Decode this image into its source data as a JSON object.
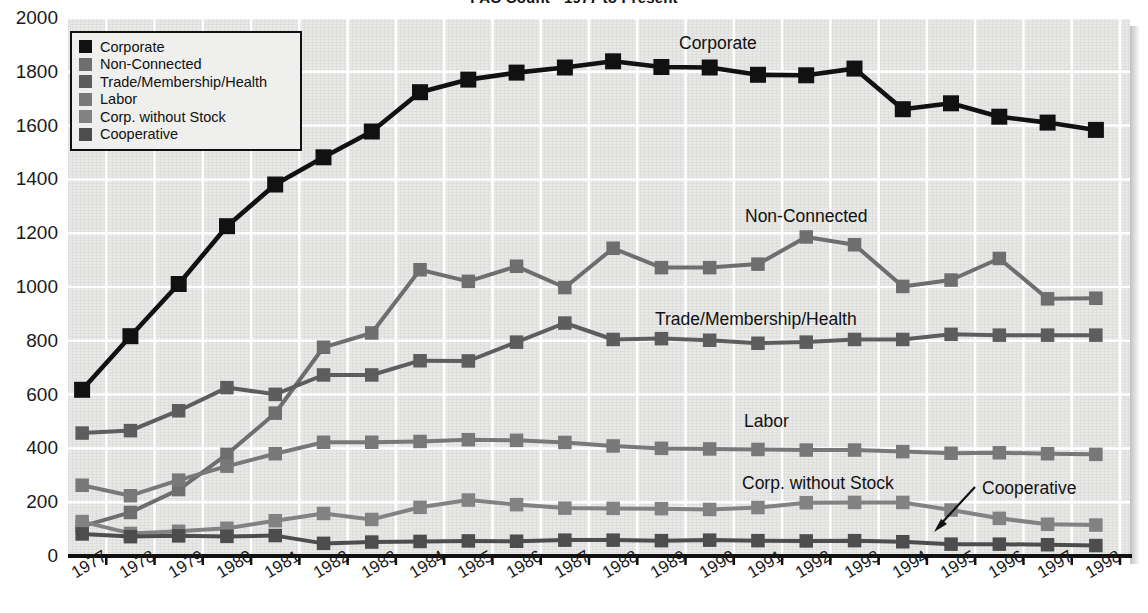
{
  "chart_data": {
    "type": "line",
    "title": "PAC Count - 1977 to Present",
    "xlabel": "",
    "ylabel": "",
    "ylim": [
      0,
      2000
    ],
    "ytick_step": 200,
    "grid": true,
    "legend_position": "top-left",
    "categories": [
      "1977",
      "1978",
      "1979",
      "1980",
      "1981",
      "1982",
      "1983",
      "1984",
      "1985",
      "1986",
      "1987",
      "1988",
      "1989",
      "1990",
      "1991",
      "1992",
      "1993",
      "1994",
      "1995",
      "1996",
      "1997",
      "1998"
    ],
    "series": [
      {
        "name": "Corporate",
        "color": "#111111",
        "values": [
          618,
          817,
          1011,
          1226,
          1381,
          1482,
          1578,
          1724,
          1771,
          1797,
          1816,
          1839,
          1818,
          1816,
          1789,
          1787,
          1812,
          1661,
          1683,
          1633,
          1611,
          1584
        ]
      },
      {
        "name": "Non-Connected",
        "color": "#6e6e6e",
        "values": [
          110,
          162,
          247,
          378,
          531,
          776,
          829,
          1064,
          1021,
          1077,
          998,
          1144,
          1072,
          1072,
          1085,
          1186,
          1157,
          1002,
          1026,
          1106,
          956,
          958
        ]
      },
      {
        "name": "Trade/Membership/Health",
        "color": "#5d5d5d",
        "values": [
          457,
          466,
          540,
          626,
          601,
          673,
          673,
          726,
          725,
          795,
          866,
          805,
          808,
          802,
          791,
          795,
          805,
          805,
          824,
          821,
          821,
          821
        ]
      },
      {
        "name": "Labor",
        "color": "#787878",
        "values": [
          263,
          224,
          282,
          334,
          380,
          423,
          423,
          426,
          432,
          430,
          422,
          409,
          400,
          398,
          396,
          394,
          394,
          388,
          382,
          384,
          380,
          378
        ]
      },
      {
        "name": "Corp. without Stock",
        "color": "#828282",
        "values": [
          128,
          84,
          92,
          103,
          131,
          158,
          136,
          181,
          208,
          191,
          178,
          177,
          176,
          173,
          180,
          198,
          199,
          199,
          171,
          140,
          118,
          115
        ]
      },
      {
        "name": "Cooperative",
        "color": "#4d4d4d",
        "values": [
          82,
          72,
          75,
          73,
          76,
          47,
          52,
          54,
          56,
          55,
          59,
          59,
          57,
          59,
          57,
          56,
          57,
          53,
          44,
          44,
          42,
          39
        ]
      }
    ],
    "annotations": [
      {
        "text": "Corporate",
        "series": "Corporate"
      },
      {
        "text": "Non-Connected",
        "series": "Non-Connected"
      },
      {
        "text": "Trade/Membership/Health",
        "series": "Trade/Membership/Health"
      },
      {
        "text": "Labor",
        "series": "Labor"
      },
      {
        "text": "Corp. without Stock",
        "series": "Corp. without Stock"
      },
      {
        "text": "Cooperative",
        "series": "Cooperative",
        "has_arrow": true
      }
    ]
  },
  "legend": {
    "items": [
      {
        "label": "Corporate",
        "color": "#111111"
      },
      {
        "label": "Non-Connected",
        "color": "#6e6e6e"
      },
      {
        "label": "Trade/Membership/Health",
        "color": "#5d5d5d"
      },
      {
        "label": "Labor",
        "color": "#787878"
      },
      {
        "label": "Corp. without Stock",
        "color": "#828282"
      },
      {
        "label": "Cooperative",
        "color": "#4d4d4d"
      }
    ]
  },
  "axes": {
    "y_ticks": [
      "2000",
      "1800",
      "1600",
      "1400",
      "1200",
      "1000",
      "800",
      "600",
      "400",
      "200",
      "0"
    ],
    "x_ticks": [
      "1977",
      "1978",
      "1979",
      "1980",
      "1981",
      "1982",
      "1983",
      "1984",
      "1985",
      "1986",
      "1987",
      "1988",
      "1989",
      "1990",
      "1991",
      "1992",
      "1993",
      "1994",
      "1995",
      "1996",
      "1997",
      "1998"
    ]
  }
}
